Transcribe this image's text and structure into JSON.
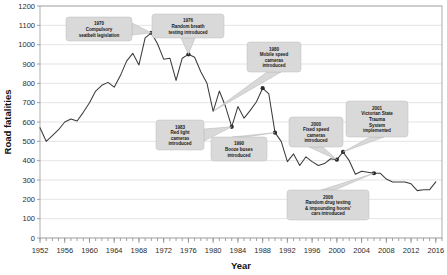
{
  "chart_data": {
    "type": "line",
    "title": "",
    "xlabel": "Year",
    "ylabel": "Road fatalities",
    "xlim": [
      1952,
      2017
    ],
    "ylim": [
      0,
      1200
    ],
    "ytick_step": 100,
    "xtick_step": 4,
    "minor_xtick_step": 1,
    "grid": true,
    "legend": "none",
    "yticks": [
      "0",
      "100",
      "200",
      "300",
      "400",
      "500",
      "600",
      "700",
      "800",
      "900",
      "1000",
      "1100",
      "1200"
    ],
    "xticks": [
      "1952",
      "1956",
      "1960",
      "1964",
      "1968",
      "1972",
      "1976",
      "1980",
      "1984",
      "1988",
      "1992",
      "1996",
      "2000",
      "2004",
      "2008",
      "2012",
      "2016"
    ],
    "series": [
      {
        "name": "Road fatalities",
        "x": [
          1952,
          1953,
          1954,
          1955,
          1956,
          1957,
          1958,
          1959,
          1960,
          1961,
          1962,
          1963,
          1964,
          1965,
          1966,
          1967,
          1968,
          1969,
          1970,
          1971,
          1972,
          1973,
          1974,
          1975,
          1976,
          1977,
          1978,
          1979,
          1980,
          1981,
          1982,
          1983,
          1984,
          1985,
          1986,
          1987,
          1988,
          1989,
          1990,
          1991,
          1992,
          1993,
          1994,
          1995,
          1996,
          1997,
          1998,
          1999,
          2000,
          2001,
          2002,
          2003,
          2004,
          2005,
          2006,
          2007,
          2008,
          2009,
          2010,
          2011,
          2012,
          2013,
          2014,
          2015,
          2016
        ],
        "values": [
          570,
          500,
          530,
          560,
          600,
          615,
          605,
          650,
          700,
          760,
          790,
          805,
          780,
          840,
          915,
          955,
          895,
          1035,
          1061,
          1005,
          925,
          930,
          815,
          930,
          950,
          935,
          860,
          800,
          655,
          760,
          680,
          575,
          680,
          620,
          660,
          705,
          775,
          745,
          545,
          500,
          395,
          435,
          375,
          420,
          395,
          375,
          385,
          410,
          405,
          445,
          400,
          330,
          345,
          340,
          335,
          335,
          305,
          290,
          290,
          290,
          280,
          245,
          250,
          250,
          290
        ],
        "annotated_points": [
          {
            "year": 1970,
            "value": 1061
          },
          {
            "year": 1976,
            "value": 950
          },
          {
            "year": 1983,
            "value": 575
          },
          {
            "year": 1990,
            "value": 545
          },
          {
            "year": 1988,
            "value": 775
          },
          {
            "year": 2000,
            "value": 405
          },
          {
            "year": 2001,
            "value": 445
          },
          {
            "year": 2006,
            "value": 335
          }
        ]
      }
    ],
    "annotations": [
      {
        "id": "a1970",
        "year": 1970,
        "lines": [
          "1970",
          "Compulsory",
          "seatbelt legislation"
        ]
      },
      {
        "id": "a1976",
        "year": 1976,
        "lines": [
          "1976",
          "Random breath",
          "testing introduced"
        ]
      },
      {
        "id": "a1980",
        "year": 1980,
        "lines": [
          "1980",
          "Mobile speed",
          "cameras",
          "introduced"
        ]
      },
      {
        "id": "a1983",
        "year": 1983,
        "lines": [
          "1983",
          "Red light",
          "cameras",
          "introduced"
        ]
      },
      {
        "id": "a1990",
        "year": 1990,
        "lines": [
          "1990",
          "Booze buses",
          "introduced"
        ]
      },
      {
        "id": "a2000",
        "year": 2000,
        "lines": [
          "2000",
          "Fixed speed",
          "cameras",
          "introduced"
        ]
      },
      {
        "id": "a2001",
        "year": 2001,
        "lines": [
          "2001",
          "Victorian State",
          "Trauma",
          "System",
          "implemented"
        ]
      },
      {
        "id": "a2006",
        "year": 2006,
        "lines": [
          "2006",
          "Random drug testing",
          "& impounding hoons'",
          "cars introduced"
        ]
      }
    ],
    "colors": {
      "line": "#3c3c3c",
      "callout_fill": "#d9d9d9",
      "callout_stroke": "#bfbfbf",
      "grid": "#d2d2d2",
      "axis": "#8a8a8a"
    }
  }
}
